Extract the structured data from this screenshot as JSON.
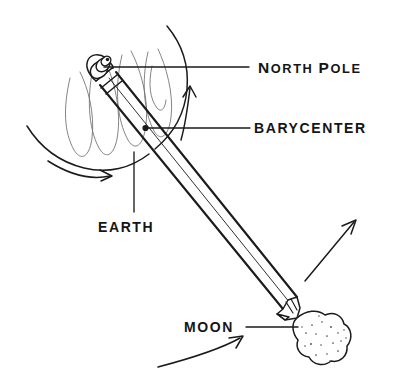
{
  "diagram": {
    "background_color": "#ffffff",
    "ink_color": "#1b1b1b",
    "faint_ink_color": "#6e6e6e",
    "style": "hand-drawn pen sketch"
  },
  "labels": {
    "north_pole": {
      "text": "NORTH POLE",
      "lead_caps": "N",
      "rest_1": "ORTH",
      "lead_caps_2": "P",
      "rest_2": "OLE",
      "full": "NORTH POLE"
    },
    "barycenter": {
      "text": "BARYCENTER",
      "full": "BARYCENTER"
    },
    "earth": {
      "text": "EARTH",
      "full": "EARTH"
    },
    "moon": {
      "text": "MOON",
      "full": "MOON"
    }
  },
  "objects": {
    "earth": {
      "name": "earth-sphere",
      "description": "large open circle arc with faint wavy meridian curves"
    },
    "moon": {
      "name": "moon-blob",
      "description": "small lumpy cratered sphere with stipple dots"
    },
    "pencil": {
      "name": "pencil",
      "description": "pencil with eraser and ferrule at north pole end, sharpened tip at moon"
    },
    "barycenter_dot": {
      "name": "barycenter-dot",
      "description": "small filled dot on pencil body inside earth"
    }
  },
  "arrows": {
    "earth_rotation_right": "curved arrow up along earth right edge",
    "earth_rotation_bottom": "curved arrow pointing right below earth",
    "moon_orbit_upper": "straight diagonal arrow pointing up-right",
    "moon_orbit_lower": "curved arrow pointing up-right below moon"
  }
}
